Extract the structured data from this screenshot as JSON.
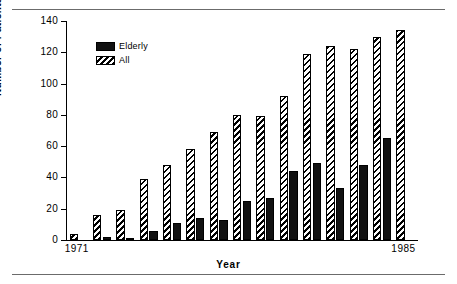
{
  "figure": {
    "rule_color": "#6b6b6b",
    "background": "#ffffff"
  },
  "legend": {
    "position": "top-left-inside",
    "entries": [
      {
        "label": "Elderly",
        "swatch": "solid-black",
        "color": "#111111"
      },
      {
        "label": "All",
        "swatch": "diagonal-hatch",
        "color": "#000000"
      }
    ]
  },
  "chart_data": {
    "type": "bar",
    "title": "",
    "xlabel": "Year",
    "ylabel": "Number of Patients",
    "ylim": [
      0,
      140
    ],
    "yticks": [
      0,
      20,
      40,
      60,
      80,
      100,
      120,
      140
    ],
    "ytick_labels": [
      "0",
      "20",
      "40",
      "60",
      "80",
      "100",
      "120",
      "140"
    ],
    "grid": false,
    "legend_position": "upper left",
    "categories": [
      "1971",
      "1972",
      "1973",
      "1974",
      "1975",
      "1976",
      "1977",
      "1978",
      "1979",
      "1980",
      "1981",
      "1982",
      "1983",
      "1984",
      "1985"
    ],
    "xtick_labels_shown": [
      "1971",
      "1985"
    ],
    "series": [
      {
        "name": "Elderly",
        "fill": "solid",
        "color": "#111111",
        "values": [
          0,
          2,
          1,
          6,
          11,
          14,
          13,
          25,
          27,
          44,
          49,
          33,
          48,
          65,
          0
        ]
      },
      {
        "name": "All",
        "fill": "hatch",
        "color": "#000000",
        "values": [
          4,
          16,
          19,
          39,
          48,
          58,
          69,
          80,
          79,
          92,
          119,
          124,
          122,
          130,
          134
        ]
      }
    ]
  }
}
